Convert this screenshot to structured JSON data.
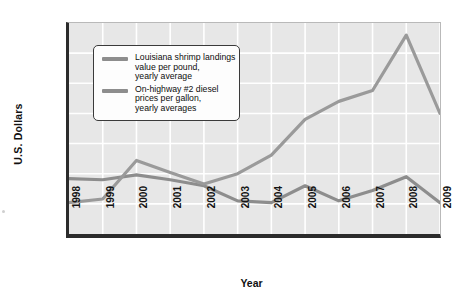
{
  "axis": {
    "y_title": "U.S. Dollars",
    "x_title": "Year"
  },
  "legend": {
    "items": [
      {
        "swatch": "grey-line-swatch",
        "lines": [
          "Louisiana shrimp landings",
          "value per pound,",
          "yearly average"
        ]
      },
      {
        "swatch": "grey-line-swatch",
        "lines": [
          "On-highway #2 diesel",
          "prices per gallon,",
          "yearly averages"
        ]
      }
    ]
  },
  "colors": {
    "plot_background": "#e7e7e7",
    "gridline": "#ffffff",
    "axis": "#2b2b2b",
    "series_shrimp": "#8d8d8d",
    "series_diesel": "#9a9a9a",
    "legend_background": "#fdfdfd",
    "legend_border": "#3a3a3a",
    "text": "#141414"
  },
  "chart_data": {
    "type": "line",
    "title": "",
    "xlabel": "Year",
    "ylabel": "U.S. Dollars",
    "categories": [
      "1998",
      "1999",
      "2000",
      "2001",
      "2002",
      "2003",
      "2004",
      "2005",
      "2006",
      "2007",
      "2008",
      "2009"
    ],
    "ytick_labels": [
      "$4.00",
      "$3.50",
      "$3.00",
      "$2.50",
      "$2.00",
      "$1.50",
      "$1.00",
      "$0.50"
    ],
    "ytick_values": [
      4.0,
      3.5,
      3.0,
      2.5,
      2.0,
      1.5,
      1.0,
      0.5
    ],
    "ylim": [
      0.5,
      4.0
    ],
    "grid": true,
    "legend_position": "upper-left-inside",
    "series": [
      {
        "name": "Louisiana shrimp landings value per pound, yearly average",
        "values": [
          1.42,
          1.4,
          1.48,
          1.4,
          1.3,
          1.05,
          1.02,
          1.3,
          1.05,
          1.22,
          1.45,
          1.02
        ]
      },
      {
        "name": "On-highway #2 diesel prices per gallon, yearly averages",
        "values": [
          1.02,
          1.08,
          1.72,
          1.52,
          1.33,
          1.5,
          1.81,
          2.4,
          2.7,
          2.88,
          3.8,
          2.5
        ]
      }
    ]
  }
}
